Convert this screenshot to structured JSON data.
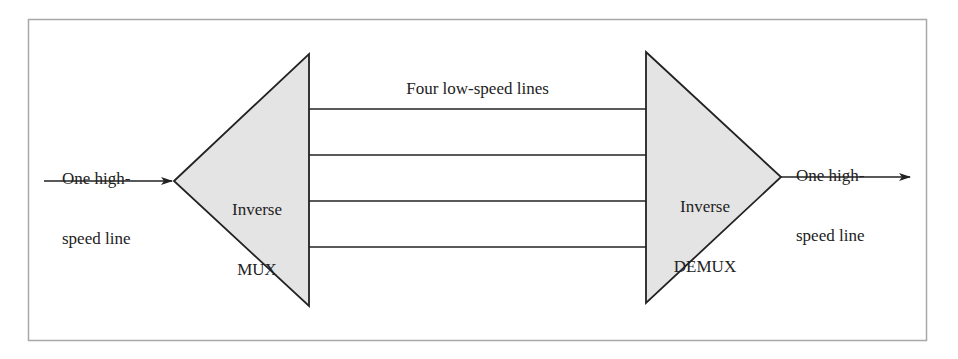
{
  "diagram": {
    "colors": {
      "frame": "#a8a8a8",
      "stroke": "#222222",
      "fill": "#e4e4e4",
      "text": "#222222"
    },
    "input": {
      "label_line1": "One high-",
      "label_line2": "speed line"
    },
    "mux": {
      "label_line1": "Inverse",
      "label_line2": "MUX"
    },
    "links": {
      "label": "Four low-speed lines",
      "count": 4
    },
    "demux": {
      "label_line1": "Inverse",
      "label_line2": "DEMUX"
    },
    "output": {
      "label_line1": "One high-",
      "label_line2": "speed line"
    }
  }
}
